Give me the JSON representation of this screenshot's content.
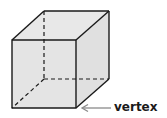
{
  "diagram": {
    "type": "cube",
    "label": "vertex",
    "colors": {
      "face_fill": "#e6e6e6",
      "edge": "#1a1a1a",
      "arrow": "#8a8a8a"
    }
  }
}
